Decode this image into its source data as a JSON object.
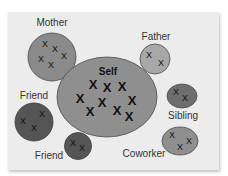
{
  "nodes": [
    {
      "id": "self",
      "label": "Self",
      "fill": "#8f8f8f",
      "marks": 9
    },
    {
      "id": "mother",
      "label": "Mother",
      "fill": "#8a8a8a",
      "marks": 5
    },
    {
      "id": "father",
      "label": "Father",
      "fill": "#a8a8a8",
      "marks": 2
    },
    {
      "id": "friend1",
      "label": "Friend",
      "fill": "#555555",
      "marks": 3
    },
    {
      "id": "friend2",
      "label": "Friend",
      "fill": "#555555",
      "marks": 2
    },
    {
      "id": "sibling",
      "label": "Sibling",
      "fill": "#6e6e6e",
      "marks": 2
    },
    {
      "id": "coworker",
      "label": "Coworker",
      "fill": "#8f8f8f",
      "marks": 3
    }
  ],
  "mark_glyph": "X",
  "colors": {
    "card": "#ececec",
    "stroke": "#4a4a4a",
    "text": "#333333"
  }
}
